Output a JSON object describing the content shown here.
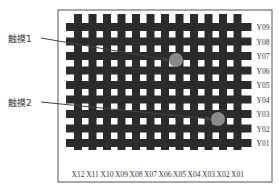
{
  "diagram": {
    "type": "touch-sensor-grid",
    "frame": {
      "x": 58,
      "y": 10,
      "w": 214,
      "h": 172
    },
    "grid": {
      "x_start": 78,
      "x_pitch": 14.5,
      "col_count": 12,
      "y_start": 22,
      "y_pitch": 14.5,
      "row_count": 9,
      "line_width": 8
    },
    "colors": {
      "grid_line": "#2b2b2b",
      "frame": "#555555",
      "touch_point": "#8a8a8a",
      "leader_line": "#444444",
      "text": "#333333"
    },
    "x_labels": [
      "X12",
      "X11",
      "X10",
      "X09",
      "X08",
      "X07",
      "X06",
      "X05",
      "X04",
      "X03",
      "X02",
      "X01"
    ],
    "y_labels": [
      "Y09",
      "Y08",
      "Y07",
      "Y06",
      "Y05",
      "Y04",
      "Y03",
      "Y02",
      "Y01"
    ],
    "touches": [
      {
        "label": "触摸1",
        "label_x": 8,
        "label_y": 38,
        "cx": 176,
        "cy": 60,
        "r": 7
      },
      {
        "label": "触摸2",
        "label_x": 8,
        "label_y": 102,
        "cx": 218,
        "cy": 119,
        "r": 7
      }
    ]
  }
}
